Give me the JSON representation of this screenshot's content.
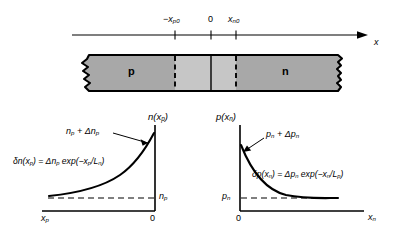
{
  "figure": {
    "colors": {
      "ink": "#000000",
      "background": "#ffffff",
      "bar_fill": "#a8a8a8",
      "bar_fill_light": "#c9c9c9",
      "bar_outline": "#000000"
    }
  },
  "axis_top": {
    "name": "position-axis",
    "arrow_label": "x",
    "ticks": [
      {
        "name": "tick-minus-xp0",
        "label_html": "−x<sub>p0</sub>",
        "label_text": "-x_p0"
      },
      {
        "name": "tick-zero",
        "label_html": "0",
        "label_text": "0"
      },
      {
        "name": "tick-xn0",
        "label_html": "x<sub>n0</sub>",
        "label_text": "x_n0"
      }
    ]
  },
  "bar": {
    "name": "pn-junction-bar",
    "p_region_label": "p",
    "n_region_label": "n",
    "depletion_edges": [
      "-x_p0",
      "x_n0"
    ],
    "junction_label": "0"
  },
  "chart_data": [
    {
      "type": "line",
      "name": "p-side-electron-profile",
      "title": "",
      "ylabel_html": "n(x<sub>p</sub>)",
      "ylabel_text": "n(x_p)",
      "xlabel_left_html": "x<sub>p</sub>",
      "xlabel_left_text": "x_p",
      "xlabel_right_html": "0",
      "xlabel_right_text": "0",
      "peak_label_html": "n<sub>p</sub> + Δn<sub>p</sub>",
      "peak_label_text": "n_p + Δn_p",
      "baseline_label_html": "n<sub>p</sub>",
      "baseline_label_text": "n_p",
      "equation_html": "δn(x<sub>p</sub>) = Δn<sub>p</sub> exp(−x<sub>p</sub>/L<sub>n</sub>)",
      "equation_text": "δn(x_p) = Δn_p exp(-x_p/L_n)",
      "x_direction": "right-to-left decay toward x_p",
      "baseline_value": 0.06,
      "peak_value": 1.0,
      "decay_constant_label": "L_n",
      "x": [
        0,
        0.1,
        0.2,
        0.3,
        0.4,
        0.5,
        0.6,
        0.7,
        0.8,
        0.9,
        1.0
      ],
      "y": [
        0.24,
        0.27,
        0.3,
        0.34,
        0.39,
        0.45,
        0.53,
        0.62,
        0.73,
        0.86,
        1.0
      ],
      "grid": false,
      "legend": "none"
    },
    {
      "type": "line",
      "name": "n-side-hole-profile",
      "title": "",
      "ylabel_html": "p(x<sub>n</sub>)",
      "ylabel_text": "p(x_n)",
      "xlabel_left_html": "0",
      "xlabel_left_text": "0",
      "xlabel_right_html": "x<sub>n</sub>",
      "xlabel_right_text": "x_n",
      "peak_label_html": "p<sub>n</sub> + Δp<sub>n</sub>",
      "peak_label_text": "p_n + Δp_n",
      "baseline_label_html": "p<sub>n</sub>",
      "baseline_label_text": "p_n",
      "equation_html": "δp(x<sub>n</sub>) = Δp<sub>n</sub> exp(−x<sub>n</sub>/L<sub>p</sub>)",
      "equation_text": "δp(x_n) = Δp_n exp(-x_n/L_p)",
      "x_direction": "left-to-right decay toward x_n",
      "baseline_value": 0.06,
      "peak_value": 1.0,
      "decay_constant_label": "L_p",
      "x": [
        0,
        0.1,
        0.2,
        0.3,
        0.4,
        0.5,
        0.6,
        0.7,
        0.8,
        0.9,
        1.0
      ],
      "y": [
        1.0,
        0.74,
        0.56,
        0.43,
        0.34,
        0.27,
        0.22,
        0.18,
        0.15,
        0.13,
        0.12
      ],
      "grid": false,
      "legend": "none"
    }
  ]
}
